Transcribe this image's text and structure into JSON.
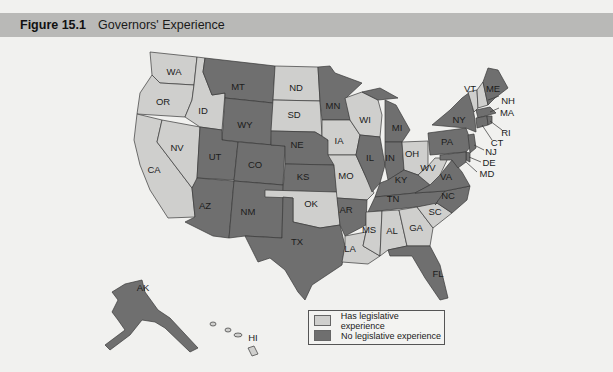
{
  "figure": {
    "number": "Figure 15.1",
    "title": "Governors' Experience"
  },
  "colors": {
    "has_experience": "#cfcfcd",
    "no_experience": "#6f6f6f",
    "background": "#f1f1ef",
    "header_bar": "#b9b9b7",
    "border": "#3a3a3a"
  },
  "legend": {
    "items": [
      {
        "label": "Has legislative experience",
        "category": "has_experience"
      },
      {
        "label": "No legislative experience",
        "category": "no_experience"
      }
    ]
  },
  "map_data": {
    "type": "choropleth",
    "has_legislative_experience": [
      "WA",
      "OR",
      "CA",
      "NV",
      "ID",
      "ND",
      "SD",
      "IA",
      "MO",
      "WI",
      "OH",
      "WV",
      "OK",
      "LA",
      "MS",
      "AL",
      "GA",
      "SC",
      "VT",
      "NH",
      "HI"
    ],
    "no_legislative_experience": [
      "MT",
      "WY",
      "UT",
      "CO",
      "AZ",
      "NM",
      "NE",
      "KS",
      "TX",
      "MN",
      "IL",
      "IN",
      "MI",
      "KY",
      "TN",
      "AR",
      "NC",
      "VA",
      "PA",
      "NY",
      "ME",
      "MA",
      "RI",
      "CT",
      "NJ",
      "DE",
      "MD",
      "FL",
      "AK"
    ]
  },
  "states": {
    "WA": "WA",
    "OR": "OR",
    "CA": "CA",
    "NV": "NV",
    "ID": "ID",
    "MT": "MT",
    "WY": "WY",
    "UT": "UT",
    "CO": "CO",
    "AZ": "AZ",
    "NM": "NM",
    "ND": "ND",
    "SD": "SD",
    "NE": "NE",
    "KS": "KS",
    "OK": "OK",
    "TX": "TX",
    "MN": "MN",
    "IA": "IA",
    "MO": "MO",
    "AR": "AR",
    "LA": "LA",
    "WI": "WI",
    "IL": "IL",
    "MI": "MI",
    "IN": "IN",
    "OH": "OH",
    "KY": "KY",
    "TN": "TN",
    "MS": "MS",
    "AL": "AL",
    "GA": "GA",
    "FL": "FL",
    "SC": "SC",
    "NC": "NC",
    "VA": "VA",
    "WV": "WV",
    "PA": "PA",
    "NY": "NY",
    "VT": "VT",
    "NH": "NH",
    "ME": "ME",
    "MA": "MA",
    "RI": "RI",
    "CT": "CT",
    "NJ": "NJ",
    "DE": "DE",
    "MD": "MD",
    "AK": "AK",
    "HI": "HI"
  }
}
